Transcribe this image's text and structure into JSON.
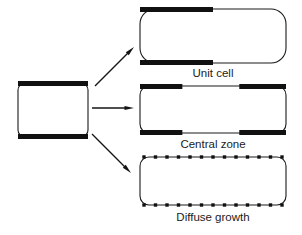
{
  "figure": {
    "type": "schematic-diagram",
    "background_color": "#ffffff",
    "ink_color": "#111111",
    "outline_color": "#1a1a1a",
    "canvas": {
      "width": 302,
      "height": 235
    },
    "source_cell": {
      "name": "source rod",
      "x": 18,
      "y": 83,
      "width": 70,
      "height": 54,
      "corner_radius": 7,
      "bars": [
        {
          "edge": "top",
          "start_fraction": 0.0,
          "end_fraction": 1.0
        },
        {
          "edge": "bottom",
          "start_fraction": 0.0,
          "end_fraction": 1.0
        }
      ]
    },
    "arrows": [
      {
        "name": "arrow-to-unit-cell",
        "x1": 95,
        "y1": 86,
        "x2": 134,
        "y2": 47
      },
      {
        "name": "arrow-to-central-zone",
        "x1": 92,
        "y1": 108,
        "x2": 134,
        "y2": 108
      },
      {
        "name": "arrow-to-diffuse-growth",
        "x1": 92,
        "y1": 134,
        "x2": 131,
        "y2": 173
      }
    ],
    "panels": [
      {
        "id": "unit-cell",
        "label": "Unit cell",
        "mode": "bars",
        "rod": {
          "x": 140,
          "y": 9,
          "width": 146,
          "height": 54,
          "corner_radius": 15
        },
        "bars": [
          {
            "edge": "top",
            "start_fraction": 0.0,
            "end_fraction": 0.5
          },
          {
            "edge": "bottom",
            "start_fraction": 0.0,
            "end_fraction": 0.5
          }
        ],
        "label_x": 213,
        "label_y": 77
      },
      {
        "id": "central-zone",
        "label": "Central zone",
        "mode": "bars",
        "rod": {
          "x": 140,
          "y": 86,
          "width": 146,
          "height": 47,
          "corner_radius": 9
        },
        "bars": [
          {
            "edge": "top",
            "start_fraction": 0.0,
            "end_fraction": 0.29
          },
          {
            "edge": "top",
            "start_fraction": 0.68,
            "end_fraction": 1.0
          },
          {
            "edge": "bottom",
            "start_fraction": 0.0,
            "end_fraction": 0.29
          },
          {
            "edge": "bottom",
            "start_fraction": 0.68,
            "end_fraction": 1.0
          }
        ],
        "label_x": 213,
        "label_y": 148
      },
      {
        "id": "diffuse-growth",
        "label": "Diffuse growth",
        "mode": "dots",
        "rod": {
          "x": 140,
          "y": 157,
          "width": 146,
          "height": 48,
          "corner_radius": 9
        },
        "dot_count": 13,
        "dot_size": 3.4,
        "label_x": 213,
        "label_y": 221
      }
    ]
  }
}
